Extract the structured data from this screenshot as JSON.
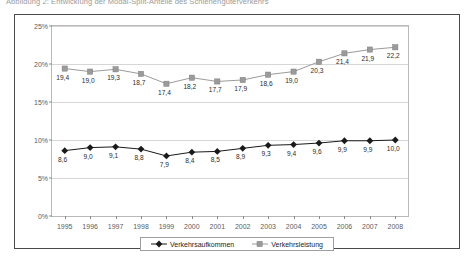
{
  "caption": "Abbildung 2:  Entwicklung der Modal-Split-Anteile des Schienengüterverkehrs",
  "chart_data": {
    "type": "line",
    "title": "",
    "xlabel": "",
    "ylabel": "",
    "categories": [
      "1995",
      "1996",
      "1997",
      "1998",
      "1999",
      "2000",
      "2001",
      "2002",
      "2003",
      "2004",
      "2005",
      "2006",
      "2007",
      "2008"
    ],
    "ylim": [
      0,
      25
    ],
    "yticks": [
      "0%",
      "5%",
      "10%",
      "15%",
      "20%",
      "25%"
    ],
    "ytick_values": [
      0,
      5,
      10,
      15,
      20,
      25
    ],
    "grid": true,
    "legend_position": "bottom",
    "series": [
      {
        "name": "Verkehrsaufkommen",
        "marker": "diamond",
        "color": "#1a1a1a",
        "values": [
          8.6,
          9.0,
          9.1,
          8.8,
          7.9,
          8.4,
          8.5,
          8.9,
          9.3,
          9.4,
          9.6,
          9.9,
          9.9,
          10.0
        ],
        "labels": [
          "8,6",
          "9,0",
          "9,1",
          "8,8",
          "7,9",
          "8,4",
          "8,5",
          "8,9",
          "9,3",
          "9,4",
          "9,6",
          "9,9",
          "9,9",
          "10,0"
        ]
      },
      {
        "name": "Verkehrsleistung",
        "marker": "square",
        "color": "#9b9b9b",
        "values": [
          19.4,
          19.0,
          19.3,
          18.7,
          17.4,
          18.2,
          17.7,
          17.9,
          18.6,
          19.0,
          20.3,
          21.4,
          21.9,
          22.2
        ],
        "labels": [
          "19,4",
          "19,0",
          "19,3",
          "18,7",
          "17,4",
          "18,2",
          "17,7",
          "17,9",
          "18,6",
          "19,0",
          "20,3",
          "21,4",
          "21,9",
          "22,2"
        ]
      }
    ]
  }
}
